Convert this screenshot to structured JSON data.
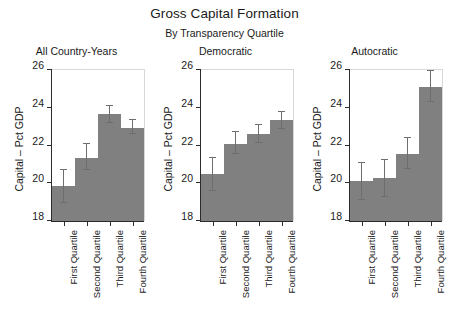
{
  "chart_data": {
    "type": "bar",
    "title": "Gross Capital Formation",
    "subtitle": "By Transparency Quartile",
    "xlabel": "",
    "ylabel": "Capital – Pct GDP",
    "ylim": [
      18,
      26
    ],
    "yticks": [
      18,
      20,
      22,
      24,
      26
    ],
    "ytick_labels": [
      "18",
      "20",
      "22",
      "24",
      "26"
    ],
    "grid": false,
    "legend": "none",
    "bar_color": "#808080",
    "error_color": "#6e6e6e",
    "categories": [
      "First Quartile",
      "Second Quartile",
      "Third Quartile",
      "Fourth Quartile"
    ],
    "panels": [
      {
        "title": "All Country-Years",
        "values": [
          19.85,
          21.35,
          23.65,
          22.95
        ],
        "err_low": [
          18.95,
          20.7,
          23.2,
          22.6
        ],
        "err_high": [
          20.7,
          22.1,
          24.1,
          23.35
        ]
      },
      {
        "title": "Democratic",
        "values": [
          20.5,
          22.1,
          22.6,
          23.35
        ],
        "err_low": [
          19.6,
          21.55,
          22.15,
          22.9
        ],
        "err_high": [
          21.35,
          22.7,
          23.1,
          23.8
        ]
      },
      {
        "title": "Autocratic",
        "values": [
          20.1,
          20.3,
          21.55,
          25.1
        ],
        "err_low": [
          19.1,
          19.25,
          20.75,
          24.3
        ],
        "err_high": [
          21.05,
          21.25,
          22.4,
          25.95
        ]
      }
    ]
  }
}
